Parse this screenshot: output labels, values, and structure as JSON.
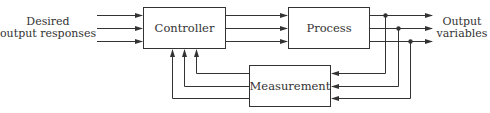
{
  "diagram": {
    "type": "block-diagram",
    "blocks": {
      "controller": {
        "label": "Controller"
      },
      "process": {
        "label": "Process"
      },
      "measurement": {
        "label": "Measurement"
      }
    },
    "input_label": {
      "line1": "Desired",
      "line2": "output responses"
    },
    "output_label": {
      "line1": "Output",
      "line2": "variables"
    },
    "connections": [
      {
        "from": "input",
        "to": "controller",
        "count": 3
      },
      {
        "from": "controller",
        "to": "process",
        "count": 3
      },
      {
        "from": "process",
        "to": "output",
        "count": 3
      },
      {
        "from": "process-output",
        "to": "measurement",
        "count": 3
      },
      {
        "from": "measurement",
        "to": "controller",
        "count": 3
      }
    ],
    "colors": {
      "line": "#333333",
      "text": "#333333",
      "background": "#ffffff"
    }
  }
}
